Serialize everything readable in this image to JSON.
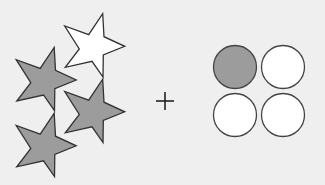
{
  "figure": {
    "background_color": "#efefef",
    "operator": "+",
    "colors": {
      "filled": "#9c9c9c",
      "empty": "#ffffff",
      "outline": "#333333"
    },
    "stars": {
      "count": 4,
      "filled_count": 3,
      "items": [
        {
          "id": "star-top-right",
          "fill": "empty"
        },
        {
          "id": "star-middle-left",
          "fill": "filled"
        },
        {
          "id": "star-middle-right",
          "fill": "filled"
        },
        {
          "id": "star-bottom-left",
          "fill": "filled"
        }
      ]
    },
    "circles": {
      "grid": "2x2",
      "count": 4,
      "filled_count": 1,
      "items": [
        {
          "id": "circle-top-left",
          "fill": "filled"
        },
        {
          "id": "circle-top-right",
          "fill": "empty"
        },
        {
          "id": "circle-bottom-left",
          "fill": "empty"
        },
        {
          "id": "circle-bottom-right",
          "fill": "empty"
        }
      ]
    }
  }
}
